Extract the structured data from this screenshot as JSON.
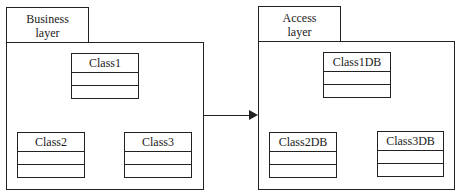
{
  "packages": [
    {
      "id": "business",
      "label_line1": "Business",
      "label_line2": "layer",
      "classes": [
        {
          "name": "Class1"
        },
        {
          "name": "Class2"
        },
        {
          "name": "Class3"
        }
      ]
    },
    {
      "id": "access",
      "label_line1": "Access",
      "label_line2": "layer",
      "classes": [
        {
          "name": "Class1DB"
        },
        {
          "name": "Class2DB"
        },
        {
          "name": "Class3DB"
        }
      ]
    }
  ],
  "relationship": {
    "from": "Business layer",
    "to": "Access layer",
    "type": "dependency-arrow"
  }
}
